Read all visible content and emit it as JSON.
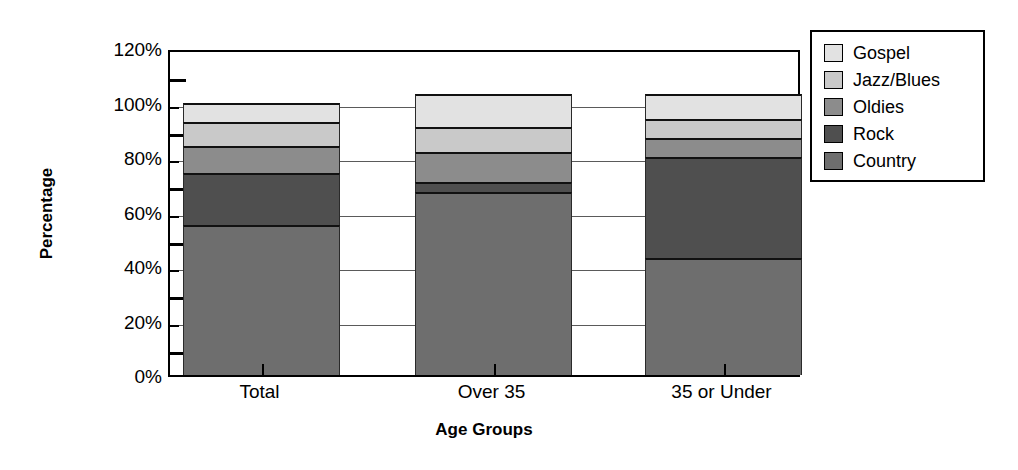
{
  "chart_data": {
    "type": "bar",
    "subtype": "stacked-bar-100",
    "title": "",
    "xlabel": "Age Groups",
    "ylabel": "Percentage",
    "categories": [
      "Total",
      "Over 35",
      "35 or Under"
    ],
    "series": [
      {
        "name": "Country",
        "color": "#6e6e6e",
        "values": [
          55,
          67,
          43
        ]
      },
      {
        "name": "Rock",
        "color": "#4f4f4f",
        "values": [
          19,
          4,
          37
        ]
      },
      {
        "name": "Oldies",
        "color": "#8c8c8c",
        "values": [
          10,
          11,
          7
        ]
      },
      {
        "name": "Jazz/Blues",
        "color": "#c9c9c9",
        "values": [
          9,
          9,
          7
        ]
      },
      {
        "name": "Gospel",
        "color": "#e2e2e2",
        "values": [
          7,
          12,
          9
        ]
      }
    ],
    "stack_totals": [
      100,
      103,
      103
    ],
    "ylim": [
      0,
      120
    ],
    "ytick_values": [
      0,
      20,
      40,
      60,
      80,
      100,
      120
    ],
    "ytick_labels": [
      "0%",
      "20%",
      "40%",
      "60%",
      "80%",
      "100%",
      "120%"
    ],
    "yminor_values": [
      10,
      30,
      50,
      70,
      90,
      110
    ],
    "grid": "horizontal-major",
    "legend_position": "right-outside",
    "legend_order": [
      "Gospel",
      "Jazz/Blues",
      "Oldies",
      "Rock",
      "Country"
    ]
  },
  "axes": {
    "y_title": "Percentage",
    "x_title": "Age Groups",
    "y_ticks": [
      "120%",
      "100%",
      "80%",
      "60%",
      "40%",
      "20%",
      "0%"
    ],
    "x_ticks": [
      "Total",
      "Over 35",
      "35 or Under"
    ]
  },
  "legend": {
    "items": [
      {
        "label": "Gospel",
        "color": "#e2e2e2"
      },
      {
        "label": "Jazz/Blues",
        "color": "#c9c9c9"
      },
      {
        "label": "Oldies",
        "color": "#8c8c8c"
      },
      {
        "label": "Rock",
        "color": "#4f4f4f"
      },
      {
        "label": "Country",
        "color": "#6e6e6e"
      }
    ]
  }
}
